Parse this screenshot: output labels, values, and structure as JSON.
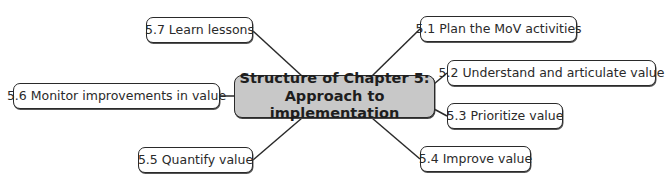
{
  "diagram": {
    "type": "mind-map",
    "center": {
      "line1": "Structure of Chapter 5:",
      "line2": "Approach to implementation"
    },
    "branches": [
      {
        "id": "5.1",
        "label": "5.1 Plan the MoV activities",
        "side": "right"
      },
      {
        "id": "5.2",
        "label": "5.2 Understand and articulate value",
        "side": "right"
      },
      {
        "id": "5.3",
        "label": "5.3 Prioritize value",
        "side": "right"
      },
      {
        "id": "5.4",
        "label": "5.4 Improve value",
        "side": "right"
      },
      {
        "id": "5.5",
        "label": "5.5 Quantify value",
        "side": "left"
      },
      {
        "id": "5.6",
        "label": "5.6 Monitor improvements in value",
        "side": "left"
      },
      {
        "id": "5.7",
        "label": "5.7 Learn lessons",
        "side": "left"
      }
    ],
    "colors": {
      "center_fill": "#c8c8c8",
      "node_fill": "#ffffff",
      "stroke": "#2a2a2a"
    }
  }
}
